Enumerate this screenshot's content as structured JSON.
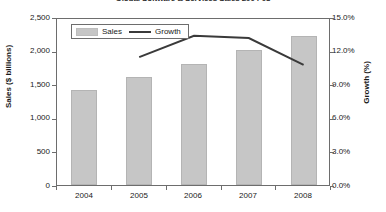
{
  "chart_data": {
    "type": "bar",
    "title": "Global Software & Services Sales 2004-08",
    "xlabel": "",
    "ylabel": "Sales ($ billions)",
    "y2label": "Growth (%)",
    "categories": [
      "2004",
      "2005",
      "2006",
      "2007",
      "2008"
    ],
    "series": [
      {
        "name": "Sales",
        "type": "bar",
        "axis": "left",
        "unit": "$ billions",
        "color": "#c6c6c6",
        "values": [
          1420,
          1600,
          1800,
          2010,
          2220
        ]
      },
      {
        "name": "Growth",
        "type": "line",
        "axis": "right",
        "unit": "%",
        "color": "#3a3a3a",
        "values": [
          null,
          11.6,
          13.5,
          13.3,
          10.9
        ]
      }
    ],
    "ylim": [
      0,
      2500
    ],
    "y2lim": [
      0,
      15
    ],
    "yticks": [
      "0",
      "500",
      "1,000",
      "1,500",
      "2,000",
      "2,500"
    ],
    "ytick_values": [
      0,
      500,
      1000,
      1500,
      2000,
      2500
    ],
    "y2ticks": [
      "0.0%",
      "3.0%",
      "6.0%",
      "9.0%",
      "12.0%",
      "15.0%"
    ],
    "y2tick_values": [
      0,
      3,
      6,
      9,
      12,
      15
    ],
    "grid": false,
    "legend_position": "top-left",
    "legend": [
      "Sales",
      "Growth"
    ]
  }
}
